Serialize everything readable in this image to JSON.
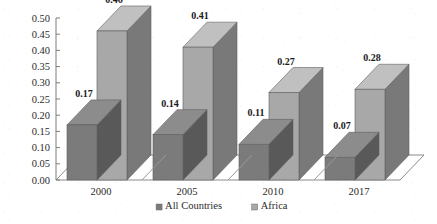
{
  "chart_data": {
    "type": "bar",
    "title": "",
    "subtitle": "",
    "xlabel": "",
    "ylabel": "",
    "categories": [
      "2000",
      "2005",
      "2010",
      "2017"
    ],
    "series": [
      {
        "name": "All Countries",
        "values": [
          0.17,
          0.14,
          0.11,
          0.07
        ],
        "color": "#7b7b7b"
      },
      {
        "name": "Africa",
        "values": [
          0.46,
          0.41,
          0.27,
          0.28
        ],
        "color": "#a8a8a8"
      }
    ],
    "value_labels": [
      [
        "0.17",
        "0.14",
        "0.11",
        "0.07"
      ],
      [
        "0.46",
        "0.41",
        "0.27",
        "0.28"
      ]
    ],
    "ylim": [
      0.0,
      0.5
    ],
    "ytick_step": 0.05,
    "ytick_labels": [
      "0.50",
      "0.45",
      "0.40",
      "0.35",
      "0.30",
      "0.25",
      "0.20",
      "0.15",
      "0.10",
      "0.05",
      "0.00"
    ],
    "ytick_values": [
      0.5,
      0.45,
      0.4,
      0.35,
      0.3,
      0.25,
      0.2,
      0.15,
      0.1,
      0.05,
      0.0
    ],
    "grid": false,
    "three_d": true,
    "legend_position": "bottom",
    "legend": [
      {
        "label": "All Countries",
        "color": "#7b7b7b"
      },
      {
        "label": "Africa",
        "color": "#a8a8a8"
      }
    ]
  }
}
